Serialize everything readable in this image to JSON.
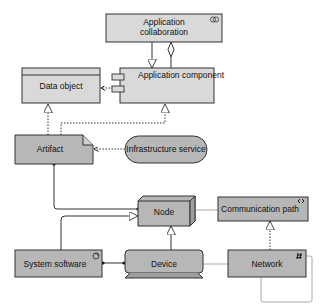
{
  "colors": {
    "app_fill": "#d9d9d9",
    "tech_fill": "#b7b7b7",
    "stroke": "#333333",
    "connector_light": "#aaaaaa"
  },
  "elements": {
    "app_collaboration": {
      "line1": "Application",
      "line2": "collaboration",
      "icon": "collaboration-icon"
    },
    "app_component": {
      "label": "Application component",
      "icon": "component-icon"
    },
    "data_object": {
      "label": "Data object"
    },
    "artifact": {
      "label": "Artifact"
    },
    "infrastructure_service": {
      "label": "Infrastructure service"
    },
    "node": {
      "label": "Node"
    },
    "communication_path": {
      "label": "Communication path",
      "icon": "communication-path-icon"
    },
    "system_software": {
      "label": "System software",
      "icon": "system-software-icon"
    },
    "device": {
      "label": "Device"
    },
    "network": {
      "label": "Network",
      "icon": "network-icon"
    }
  },
  "relationships": [
    {
      "from": "app_component",
      "to": "app_collaboration",
      "type": "aggregation"
    },
    {
      "from": "app_collaboration",
      "to": "app_component",
      "type": "specialization"
    },
    {
      "from": "app_component",
      "to": "data_object",
      "type": "access"
    },
    {
      "from": "artifact",
      "to": "data_object",
      "type": "realization"
    },
    {
      "from": "artifact",
      "to": "app_component",
      "type": "realization"
    },
    {
      "from": "infrastructure_service",
      "to": "artifact",
      "type": "access"
    },
    {
      "from": "artifact",
      "to": "node",
      "type": "assignment"
    },
    {
      "from": "system_software",
      "to": "node",
      "type": "specialization"
    },
    {
      "from": "device",
      "to": "node",
      "type": "specialization"
    },
    {
      "from": "device",
      "to": "system_software",
      "type": "assignment"
    },
    {
      "from": "node",
      "to": "communication_path",
      "type": "association"
    },
    {
      "from": "network",
      "to": "communication_path",
      "type": "realization"
    },
    {
      "from": "device",
      "to": "network",
      "type": "association"
    },
    {
      "from": "network",
      "to": "network",
      "type": "association"
    }
  ]
}
